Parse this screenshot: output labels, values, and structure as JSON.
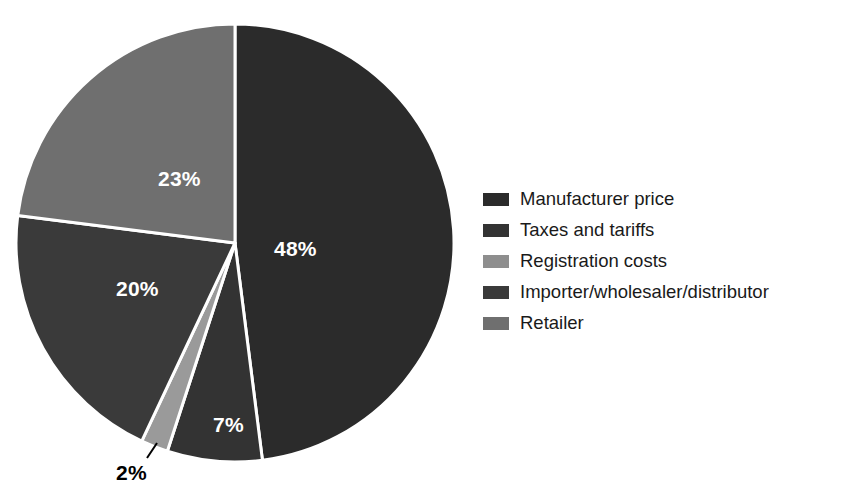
{
  "chart_data": {
    "type": "pie",
    "title": "",
    "subtitle": "",
    "xlabel": "",
    "ylabel": "",
    "legend_position": "right",
    "grid": false,
    "units": "%",
    "start_angle_deg": 0,
    "direction": "clockwise",
    "categories": [
      "Manufacturer price",
      "Taxes and tariffs",
      "Registration costs",
      "Importer/wholesaler/distributor",
      "Retailer"
    ],
    "values": [
      48,
      7,
      2,
      20,
      23
    ],
    "slices": [
      {
        "label": "Manufacturer price",
        "value": 48,
        "display": "48%",
        "color": "#2b2b2b",
        "label_color": "#ffffff",
        "label_placement": "inside"
      },
      {
        "label": "Taxes and tariffs",
        "value": 7,
        "display": "7%",
        "color": "#333333",
        "label_color": "#ffffff",
        "label_placement": "inside"
      },
      {
        "label": "Registration costs",
        "value": 2,
        "display": "2%",
        "color": "#9a9a9a",
        "label_color": "#000000",
        "label_placement": "outside"
      },
      {
        "label": "Importer/wholesaler/distributor",
        "value": 20,
        "display": "20%",
        "color": "#3a3a3a",
        "label_color": "#ffffff",
        "label_placement": "inside"
      },
      {
        "label": "Retailer",
        "value": 23,
        "display": "23%",
        "color": "#6f6f6f",
        "label_color": "#ffffff",
        "label_placement": "inside"
      }
    ]
  },
  "pie": {
    "center_x": 235,
    "center_y": 243,
    "radius": 219,
    "separator_color": "#ffffff",
    "separator_width": 3,
    "labels": {
      "v48": "48%",
      "v23": "23%",
      "v20": "20%",
      "v7": "7%",
      "v2": "2%"
    }
  },
  "legend": {
    "items": [
      {
        "label": "Manufacturer price",
        "color": "#2b2b2b"
      },
      {
        "label": "Taxes and tariffs",
        "color": "#333333"
      },
      {
        "label": "Registration costs",
        "color": "#8e8e8e"
      },
      {
        "label": "Importer/wholesaler/distributor",
        "color": "#3a3a3a"
      },
      {
        "label": "Retailer",
        "color": "#6f6f6f"
      }
    ]
  }
}
